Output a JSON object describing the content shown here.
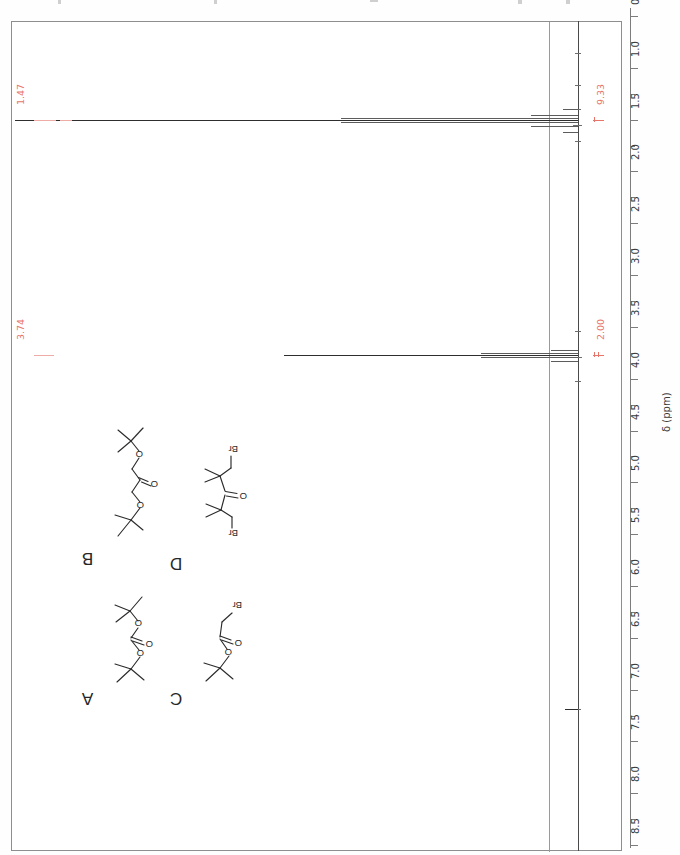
{
  "figure": {
    "kind": "1H NMR spectrum",
    "axis": {
      "title": "δ (ppm)",
      "orientation": "rotated-180",
      "min_ppm": 0.5,
      "max_ppm": 8.5,
      "tick_step": 0.5,
      "minor_tick_step": 0.25,
      "tick_labels": [
        "0.5",
        "1.0",
        "1.5",
        "2.0",
        "2.5",
        "3.0",
        "3.5",
        "4.0",
        "4.5",
        "5.0",
        "5.5",
        "6.0",
        "6.5",
        "7.0",
        "7.5",
        "8.0",
        "8.5"
      ]
    },
    "peak_labels": [
      {
        "shift": "1.47"
      },
      {
        "shift": "3.74"
      }
    ],
    "integral_labels": [
      {
        "value": "9.33"
      },
      {
        "value": "2.00"
      }
    ],
    "colors": {
      "annotation_red": "#e8746a",
      "trace_dark": "#2e2e2e",
      "axis_gray": "#7c7c7c",
      "frame_gray": "#8e8e8e"
    }
  },
  "structures": [
    {
      "letter": "A",
      "name": "di-tert-butyl carbonate",
      "atom_labels": [
        "O",
        "O",
        "O"
      ]
    },
    {
      "letter": "B",
      "name": "1,3-di-tert-butoxypropan-2-one",
      "atom_labels": [
        "O",
        "O",
        "O"
      ]
    },
    {
      "letter": "C",
      "name": "tert-butyl bromoacetate",
      "atom_labels": [
        "O",
        "O",
        "Br"
      ]
    },
    {
      "letter": "D",
      "name": "1,5-dibromo-2,2,4,4-tetramethylpentan-3-one",
      "atom_labels": [
        "Br",
        "O",
        "Br"
      ]
    }
  ],
  "chart_data": {
    "type": "line",
    "title": "",
    "xlabel": "δ (ppm)",
    "ylabel": "",
    "orientation": "vertical-axis-rotated-180",
    "xlim": [
      8.5,
      0.5
    ],
    "grid": false,
    "legend": "none",
    "annotations": [
      {
        "text": "1.47",
        "ppm": 1.47,
        "kind": "chemical-shift-label",
        "color": "#e8746a"
      },
      {
        "text": "3.74",
        "ppm": 3.74,
        "kind": "chemical-shift-label",
        "color": "#e8746a"
      },
      {
        "text": "9.33",
        "ppm": 1.47,
        "kind": "integral",
        "color": "#e8746a"
      },
      {
        "text": "2.00",
        "ppm": 3.74,
        "kind": "integral",
        "color": "#e8746a"
      }
    ],
    "peaks": [
      {
        "ppm": 1.47,
        "relative_intensity": 1.0,
        "integral": 9.33,
        "label": "1.47",
        "multiplicity": "s"
      },
      {
        "ppm": 3.74,
        "relative_intensity": 0.55,
        "integral": 2.0,
        "label": "3.74",
        "multiplicity": "s"
      },
      {
        "ppm": 7.26,
        "relative_intensity": 0.02,
        "integral": null,
        "label": "",
        "multiplicity": "s"
      }
    ],
    "axis_ticks": [
      0.5,
      1.0,
      1.5,
      2.0,
      2.5,
      3.0,
      3.5,
      4.0,
      4.5,
      5.0,
      5.5,
      6.0,
      6.5,
      7.0,
      7.5,
      8.0,
      8.5
    ]
  }
}
